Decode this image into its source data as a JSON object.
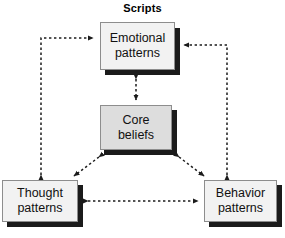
{
  "title": "Scripts",
  "diagram": {
    "type": "cycle-diagram",
    "nodes": [
      {
        "id": "emotional",
        "line1": "Emotional",
        "line2": "patterns",
        "fill": "#f2f2f2"
      },
      {
        "id": "core",
        "line1": "Core",
        "line2": "beliefs",
        "fill": "#dddddd"
      },
      {
        "id": "thought",
        "line1": "Thought",
        "line2": "patterns",
        "fill": "#f2f2f2"
      },
      {
        "id": "behavior",
        "line1": "Behavior",
        "line2": "patterns",
        "fill": "#f2f2f2"
      }
    ],
    "connections": [
      {
        "from": "thought",
        "to": "emotional",
        "style": "dashed",
        "arrows": "both",
        "routing": "elbow-left"
      },
      {
        "from": "behavior",
        "to": "emotional",
        "style": "dashed",
        "arrows": "both",
        "routing": "elbow-right"
      },
      {
        "from": "emotional",
        "to": "core",
        "style": "dashed",
        "arrows": "both",
        "routing": "vertical"
      },
      {
        "from": "core",
        "to": "thought",
        "style": "dashed",
        "arrows": "both",
        "routing": "diagonal"
      },
      {
        "from": "core",
        "to": "behavior",
        "style": "dashed",
        "arrows": "both",
        "routing": "diagonal"
      },
      {
        "from": "thought",
        "to": "behavior",
        "style": "dashed",
        "arrows": "both",
        "routing": "horizontal"
      }
    ],
    "colors": {
      "line": "#1b1b1b",
      "shadow": "#1b1b1b",
      "border": "#8d8d8d",
      "box_fill": "#f2f2f2",
      "core_fill": "#dddddd",
      "background": "#ffffff",
      "text": "#111111"
    }
  }
}
